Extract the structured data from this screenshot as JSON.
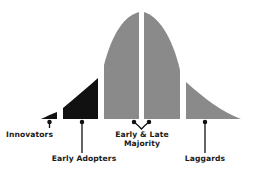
{
  "colors": {
    "early_segments": "#111111",
    "majority_segments": "#8a8a8a",
    "leader_lines": "#111111",
    "background": "#ffffff",
    "text": "#1a1a1a"
  },
  "segments": [
    {
      "id": "innovators",
      "label": "Innovators",
      "fill": "black"
    },
    {
      "id": "early-adopters",
      "label": "Early Adopters",
      "fill": "black"
    },
    {
      "id": "early-majority",
      "label": "Early Majority",
      "fill": "gray"
    },
    {
      "id": "late-majority",
      "label": "Late Majority",
      "fill": "gray"
    },
    {
      "id": "laggards",
      "label": "Laggards",
      "fill": "gray"
    }
  ],
  "labels": {
    "innovators": "Innovators",
    "early_adopters": "Early Adopters",
    "majority_line1": "Early & Late",
    "majority_line2": "Majority",
    "laggards": "Laggards"
  }
}
